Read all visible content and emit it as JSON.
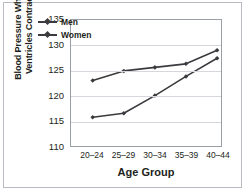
{
  "chart_data": {
    "type": "line",
    "title": "",
    "xlabel": "Age Group",
    "ylabel": "Blood Pressure When Ventricles Contract",
    "categories": [
      "20–24",
      "25–29",
      "30–34",
      "35–39",
      "40–44"
    ],
    "yticks": [
      110,
      115,
      120,
      125,
      130,
      135
    ],
    "ylim": [
      110,
      135
    ],
    "grid": "horizontal",
    "legend_position": "inside-top-left",
    "series": [
      {
        "name": "Men",
        "color": "#3b3b3f",
        "marker": "diamond",
        "values": [
          123.0,
          124.9,
          125.6,
          126.3,
          129.0
        ]
      },
      {
        "name": "Women",
        "color": "#3b3b3f",
        "marker": "diamond",
        "values": [
          115.7,
          116.5,
          120.0,
          123.8,
          127.4
        ]
      }
    ]
  },
  "figure": {
    "border_color": "#b9bcc2",
    "plot_border_color": "#9a9ea5",
    "gridline_color": "#d4d7dc",
    "background": "#ffffff",
    "text_color": "#231f20"
  }
}
